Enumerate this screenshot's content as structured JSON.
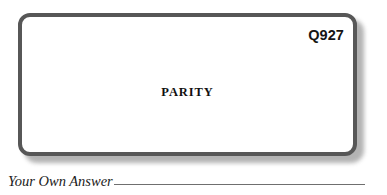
{
  "card": {
    "question_number": "Q927",
    "clue_word": "PARITY",
    "border_color": "#575757",
    "fill_color": "#ffffff",
    "shadow_color": "#9a9a9a"
  },
  "answer": {
    "label": "Your Own Answer",
    "rule_color": "#6f6f6f"
  },
  "page": {
    "background_color": "#ffffff"
  }
}
